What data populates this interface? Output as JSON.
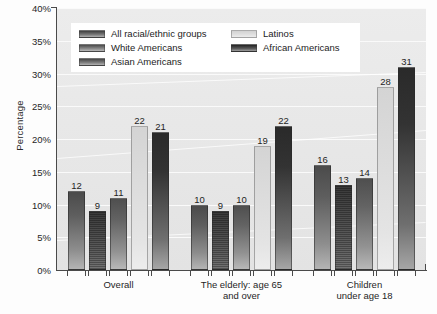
{
  "chart_data": {
    "type": "bar",
    "title": "",
    "xlabel": "",
    "ylabel": "Percentage",
    "ylim": [
      0,
      40
    ],
    "ytick_labels": [
      "0%",
      "5%",
      "10%",
      "15%",
      "20%",
      "25%",
      "30%",
      "35%",
      "40%"
    ],
    "ytick_values": [
      0,
      5,
      10,
      15,
      20,
      25,
      30,
      35,
      40
    ],
    "grid": true,
    "legend_position": "top-left-inside",
    "categories": [
      "Overall",
      "The elderly: age 65\nand over",
      "Children\nunder age 18"
    ],
    "series": [
      {
        "name": "All racial/ethnic groups",
        "color": "#5e5e5e",
        "values": [
          12,
          10,
          16
        ]
      },
      {
        "name": "White Americans",
        "color": "#8b8b8b",
        "values": [
          9,
          9,
          13
        ]
      },
      {
        "name": "Asian Americans",
        "color": "#636363",
        "values": [
          11,
          10,
          14
        ]
      },
      {
        "name": "Latinos",
        "color": "#dcdcdc",
        "values": [
          22,
          19,
          28
        ]
      },
      {
        "name": "African Americans",
        "color": "#333333",
        "values": [
          21,
          22,
          31
        ]
      }
    ]
  }
}
